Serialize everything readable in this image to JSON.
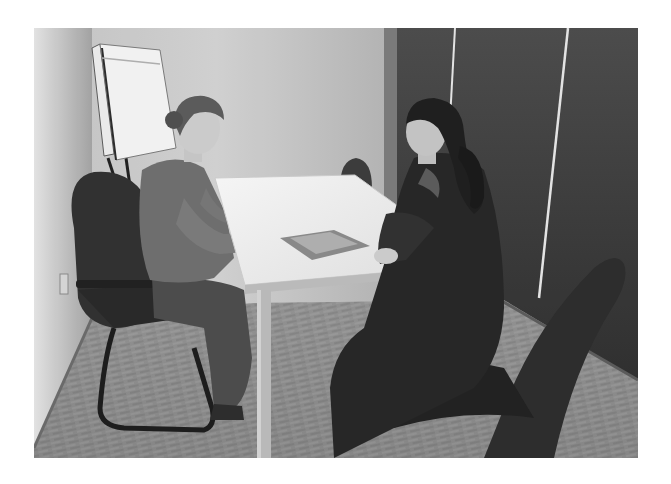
{
  "photo": {
    "alt": "Two women sitting across a white table in a small office meeting room, grayscale photograph",
    "color_mode": "grayscale",
    "colors": {
      "page_background": "#ffffff",
      "wall": "#b8b8b8",
      "partition": "#3a3a3a",
      "table": "#f2f2f2",
      "floor": "#8c8c8c",
      "chair": "#2e2e2e"
    },
    "scene": {
      "setting": "office meeting room",
      "objects": [
        "flip chart easel",
        "white rectangular table",
        "left visitor chair with cantilever frame",
        "right black swivel armchair",
        "background chair behind table",
        "brochure on table",
        "dark wall partition with light strips",
        "patterned carpet floor",
        "wall outlet"
      ],
      "people": [
        {
          "position": "left",
          "description": "woman with hair in bun, gray long-sleeve top, hands on table"
        },
        {
          "position": "right",
          "description": "woman with dark ponytail, dark jacket, smiling, hands on table edge"
        }
      ]
    }
  }
}
